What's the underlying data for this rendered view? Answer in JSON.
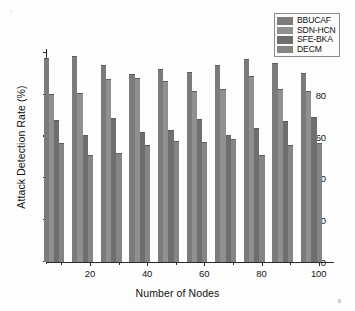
{
  "figure": {
    "background_color": "#fdfdfd",
    "axis_color": "#2b2b2b"
  },
  "axes": {
    "ylabel": "Attack Detection Rate (%)",
    "xlabel": "Number of Nodes",
    "yticks": [
      0,
      20,
      40,
      60,
      80,
      100
    ],
    "xticks": [
      20,
      40,
      60,
      80,
      100
    ]
  },
  "legend": {
    "position": "top-right",
    "border_color": "#8a8a8a",
    "items": [
      {
        "label": "BBUCAF",
        "color": "#7b7b7b"
      },
      {
        "label": "SDN-HCN",
        "color": "#909090"
      },
      {
        "label": "SFE-BKA",
        "color": "#6e6e6e"
      },
      {
        "label": "DECM",
        "color": "#858585"
      }
    ]
  },
  "chart_data": {
    "type": "bar",
    "title": "",
    "xlabel": "Number of Nodes",
    "ylabel": "Attack Detection Rate (%)",
    "ylim": [
      0,
      100
    ],
    "xlim": [
      5,
      105
    ],
    "grid": false,
    "legend_position": "top-right",
    "categories": [
      10,
      20,
      30,
      40,
      50,
      60,
      70,
      80,
      90,
      100
    ],
    "series": [
      {
        "name": "BBUCAF",
        "color": "#7b7b7b",
        "values": [
          97.5,
          98.5,
          94.5,
          90.0,
          92.5,
          91.0,
          94.5,
          97.0,
          95.0,
          90.5
        ]
      },
      {
        "name": "SDN-HCN",
        "color": "#909090",
        "values": [
          80.5,
          81.0,
          87.5,
          88.0,
          86.5,
          82.0,
          83.0,
          89.0,
          83.0,
          82.0
        ]
      },
      {
        "name": "SFE-BKA",
        "color": "#6e6e6e",
        "values": [
          68.0,
          61.0,
          69.0,
          62.0,
          63.0,
          68.5,
          61.0,
          64.0,
          67.5,
          69.5
        ]
      },
      {
        "name": "DECM",
        "color": "#858585",
        "values": [
          57.0,
          51.0,
          52.0,
          56.0,
          58.0,
          57.5,
          59.0,
          51.0,
          56.0,
          57.0
        ]
      }
    ]
  }
}
